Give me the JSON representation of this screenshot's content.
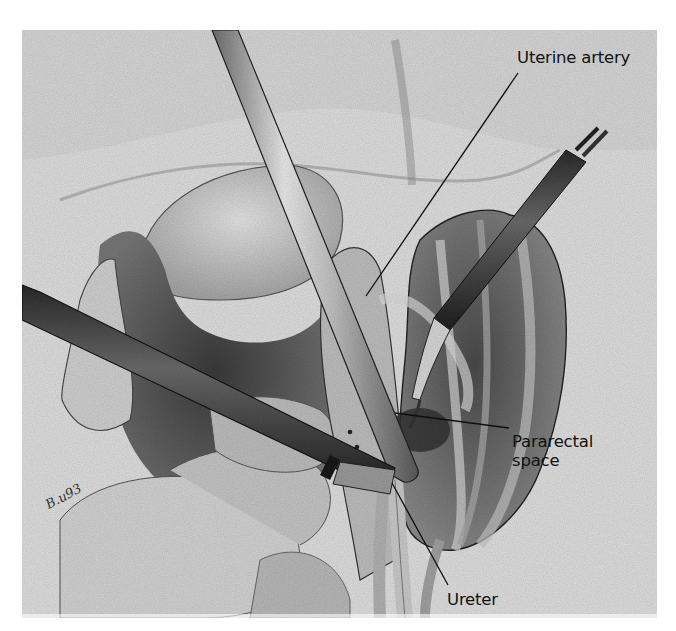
{
  "figure": {
    "type": "surgical-illustration",
    "style": "grayscale stippled pencil drawing",
    "colors": {
      "page_background": "#ffffff",
      "panel_background": "#dcdcdc",
      "ink": "#111111"
    }
  },
  "labels": {
    "uterine_artery": "Uterine artery",
    "pararectal_space_line1": "Pararectal",
    "pararectal_space_line2": "space",
    "ureter": "Ureter"
  },
  "signature": "B.u93"
}
